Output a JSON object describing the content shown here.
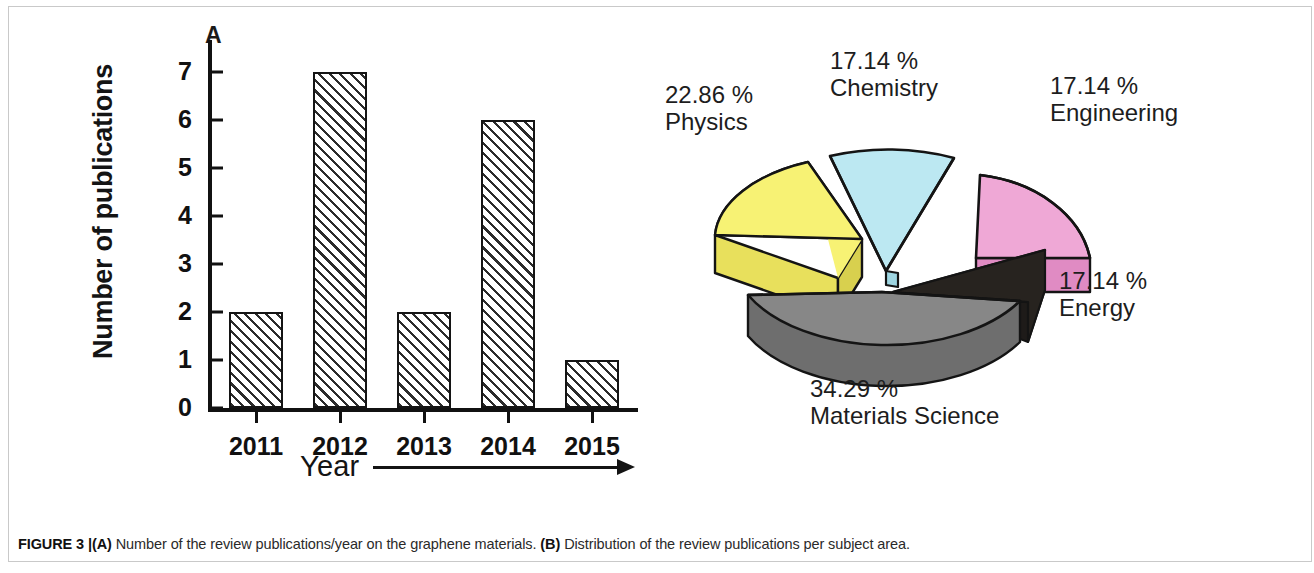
{
  "figure": {
    "caption_prefix": "FIGURE 3 |",
    "caption_a_tag": "(A)",
    "caption_a_text": " Number of the review publications/year on the graphene materials. ",
    "caption_b_tag": "(B)",
    "caption_b_text": " Distribution of the review publications per subject area."
  },
  "panel_a": {
    "letter": "A",
    "chart_data": {
      "type": "bar",
      "title": "",
      "xlabel": "Year",
      "ylabel": "Number of publications",
      "categories": [
        "2011",
        "2012",
        "2013",
        "2014",
        "2015"
      ],
      "values": [
        2,
        7,
        2,
        6,
        1
      ],
      "ylim": [
        0,
        7.5
      ],
      "yticks": [
        0,
        1,
        2,
        3,
        4,
        5,
        6,
        7
      ],
      "ytick_labels": [
        "0",
        "1",
        "2",
        "3",
        "4",
        "5",
        "6",
        "7"
      ],
      "grid": false,
      "legend": false,
      "bar_fill": "hatched-diagonal",
      "bar_edge_color": "#141414"
    }
  },
  "panel_b": {
    "letter": "B",
    "chart_data": {
      "type": "pie",
      "title": "",
      "style": "3d-exploded",
      "labels": [
        "Physics",
        "Chemistry",
        "Engineering",
        "Energy",
        "Materials Science"
      ],
      "values": [
        22.86,
        17.14,
        17.14,
        17.14,
        34.29
      ],
      "value_labels": [
        "22.86 %",
        "17.14 %",
        "17.14 %",
        "17.14 %",
        "34.29 %"
      ],
      "colors": [
        "#F7F274",
        "#BCE8F2",
        "#EFA8D6",
        "#2E2A28",
        "#878787"
      ],
      "legend": "labels-outside",
      "slices": [
        {
          "name": "Physics",
          "pct": "22.86 %",
          "color": "#F7F274"
        },
        {
          "name": "Chemistry",
          "pct": "17.14 %",
          "color": "#BCE8F2"
        },
        {
          "name": "Engineering",
          "pct": "17.14 %",
          "color": "#EFA8D6"
        },
        {
          "name": "Energy",
          "pct": "17.14 %",
          "color": "#2E2A28"
        },
        {
          "name": "Materials Science",
          "pct": "34.29 %",
          "color": "#878787"
        }
      ]
    }
  }
}
